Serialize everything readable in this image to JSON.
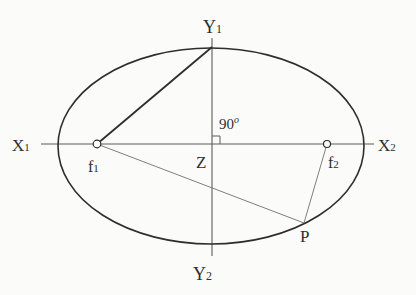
{
  "figure": {
    "background_color": "#fbfbfa",
    "ink_color": "#2e2e2e",
    "axis_color": "#5c5c5c",
    "thin_line_color": "#707070",
    "width": 416,
    "height": 295,
    "ellipse": {
      "cx": 211,
      "cy": 146,
      "rx": 153,
      "ry": 98,
      "stroke_width": 1.6
    },
    "axes": [
      {
        "name": "horizontal-axis",
        "x1": 41,
        "y1": 144,
        "x2": 374,
        "y2": 144,
        "stroke_width": 1.1
      },
      {
        "name": "vertical-axis",
        "x1": 212,
        "y1": 38,
        "x2": 212,
        "y2": 256,
        "stroke_width": 1.1
      }
    ],
    "segments": [
      {
        "name": "segment-f1-to-top-vertex",
        "x1": 97,
        "y1": 144,
        "x2": 212,
        "y2": 47,
        "stroke_width": 1.8,
        "color_role": "ink"
      },
      {
        "name": "segment-f1-to-p",
        "x1": 97,
        "y1": 144,
        "x2": 304,
        "y2": 223,
        "stroke_width": 0.9,
        "color_role": "thin"
      },
      {
        "name": "segment-f2-to-p",
        "x1": 327,
        "y1": 144,
        "x2": 304,
        "y2": 223,
        "stroke_width": 0.9,
        "color_role": "thin"
      }
    ],
    "right_angle_mark": {
      "x": 212,
      "y": 144,
      "size": 8,
      "stroke_width": 1
    },
    "foci": [
      {
        "name": "focus-f1",
        "cx": 97,
        "cy": 144,
        "r": 3.8
      },
      {
        "name": "focus-f2",
        "cx": 327,
        "cy": 144,
        "r": 3.5
      }
    ],
    "labels": [
      {
        "name": "label-y1",
        "main": "Y",
        "script": "1",
        "script_type": "sub",
        "x": 203,
        "y": 33,
        "size": 18
      },
      {
        "name": "label-y2",
        "main": "Y",
        "script": "2",
        "script_type": "sub",
        "x": 193,
        "y": 280,
        "size": 18
      },
      {
        "name": "label-x1",
        "main": "X",
        "script": "1",
        "script_type": "sub",
        "x": 12,
        "y": 151,
        "size": 17
      },
      {
        "name": "label-x2",
        "main": "X",
        "script": "2",
        "script_type": "sub",
        "x": 378,
        "y": 151,
        "size": 17
      },
      {
        "name": "label-f1",
        "main": "f",
        "script": "1",
        "script_type": "sub",
        "x": 88,
        "y": 172,
        "size": 16
      },
      {
        "name": "label-f2",
        "main": "f",
        "script": "2",
        "script_type": "sub",
        "x": 328,
        "y": 168,
        "size": 16
      },
      {
        "name": "label-z",
        "main": "Z",
        "script": "",
        "script_type": "",
        "x": 196,
        "y": 168,
        "size": 17
      },
      {
        "name": "label-p",
        "main": "P",
        "script": "",
        "script_type": "",
        "x": 300,
        "y": 242,
        "size": 17
      },
      {
        "name": "label-angle-90",
        "main": "90",
        "script": "o",
        "script_type": "sup",
        "x": 219,
        "y": 129,
        "size": 15
      }
    ]
  }
}
